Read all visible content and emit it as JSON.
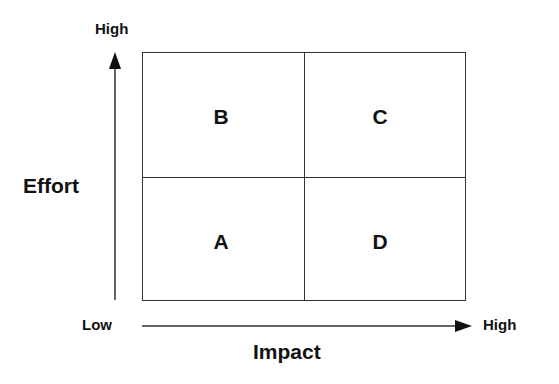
{
  "diagram": {
    "type": "2x2 matrix",
    "y_axis": {
      "label": "Effort",
      "low": "Low",
      "high": "High"
    },
    "x_axis": {
      "label": "Impact",
      "low": "Low",
      "high": "High"
    },
    "quadrants": {
      "top_left": "B",
      "top_right": "C",
      "bottom_left": "A",
      "bottom_right": "D"
    },
    "line_color": "#333333"
  }
}
